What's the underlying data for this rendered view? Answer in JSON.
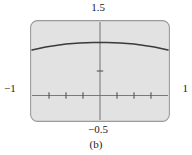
{
  "figure": {
    "caption": "(b)",
    "panel_bg": "#e2e2e2",
    "panel_border": "#9a9a9a",
    "axis_color": "#7a7a7a",
    "curve_color": "#3a3a3a"
  },
  "labels": {
    "y_max": "1.5",
    "y_min": "−0.5",
    "x_min": "−1",
    "x_max": "1"
  },
  "chart_data": {
    "type": "line",
    "title": "(b)",
    "xlabel": "",
    "ylabel": "",
    "xlim": [
      -1,
      1
    ],
    "ylim": [
      -0.5,
      1.5
    ],
    "grid": false,
    "legend": null,
    "x_tick_labels": [
      "−1",
      "1"
    ],
    "y_tick_labels": [
      "−0.5",
      "1.5"
    ],
    "x_ticks": [
      -0.75,
      -0.5,
      -0.25,
      0.25,
      0.5,
      0.75
    ],
    "y_ticks": [
      0.5
    ],
    "axes_cross_at": [
      0,
      0
    ],
    "series": [
      {
        "name": "curve",
        "x": [
          -1.0,
          -0.9,
          -0.8,
          -0.7,
          -0.6,
          -0.5,
          -0.4,
          -0.3,
          -0.2,
          -0.1,
          0.0,
          0.1,
          0.2,
          0.3,
          0.4,
          0.5,
          0.6,
          0.7,
          0.8,
          0.9,
          1.0
        ],
        "y": [
          0.93,
          0.96,
          0.99,
          1.01,
          1.03,
          1.05,
          1.06,
          1.07,
          1.075,
          1.08,
          1.08,
          1.08,
          1.075,
          1.07,
          1.06,
          1.05,
          1.03,
          1.01,
          0.99,
          0.96,
          0.93
        ]
      }
    ]
  }
}
